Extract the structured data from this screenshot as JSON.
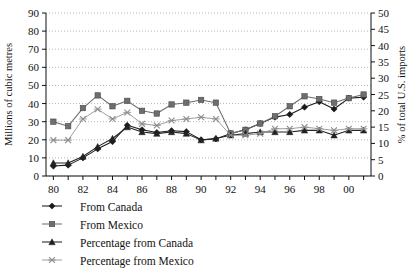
{
  "chart_data": {
    "type": "line",
    "title": "",
    "subtitle": "",
    "xlabel": "",
    "ylabel": "Millions of cubic metres",
    "y2label": "% of total U.S. imports",
    "xlim": [
      1979.5,
      2001.5
    ],
    "ylim": [
      0,
      90
    ],
    "y2lim": [
      0,
      50
    ],
    "grid": true,
    "legend_position": "below-left",
    "x": [
      1980,
      1981,
      1982,
      1983,
      1984,
      1985,
      1986,
      1987,
      1988,
      1989,
      1990,
      1991,
      1992,
      1993,
      1994,
      1995,
      1996,
      1997,
      1998,
      1999,
      2000,
      2001
    ],
    "x_tick_labels": [
      "80",
      "82",
      "84",
      "86",
      "88",
      "90",
      "92",
      "94",
      "96",
      "98",
      "00"
    ],
    "x_tick_values": [
      1980,
      1982,
      1984,
      1986,
      1988,
      1990,
      1992,
      1994,
      1996,
      1998,
      2000
    ],
    "y_tick_labels": [
      "0",
      "10",
      "20",
      "30",
      "40",
      "50",
      "60",
      "70",
      "80",
      "90"
    ],
    "y_tick_values": [
      0,
      10,
      20,
      30,
      40,
      50,
      60,
      70,
      80,
      90
    ],
    "y2_tick_labels": [
      "0",
      "5",
      "10",
      "15",
      "20",
      "25",
      "30",
      "35",
      "40",
      "45",
      "50"
    ],
    "y2_tick_values": [
      0,
      5,
      10,
      15,
      20,
      25,
      30,
      35,
      40,
      45,
      50
    ],
    "series": [
      {
        "name": "From Canada",
        "marker": "diamond",
        "axis": "left",
        "color": "#1a1a1a",
        "values": [
          5.5,
          6.0,
          10.0,
          15.0,
          19.0,
          28.0,
          25.5,
          24.0,
          25.0,
          24.5,
          20.0,
          20.5,
          23.5,
          25.5,
          29.0,
          32.5,
          34.0,
          38.0,
          41.0,
          37.0,
          43.0,
          43.5
        ]
      },
      {
        "name": "From Mexico",
        "marker": "square",
        "axis": "left",
        "color": "#6e6e6e",
        "values": [
          30.0,
          27.5,
          37.5,
          44.5,
          38.5,
          41.5,
          36.0,
          34.5,
          39.5,
          40.5,
          42.0,
          40.5,
          23.5,
          25.5,
          29.0,
          33.0,
          38.5,
          44.0,
          42.5,
          40.5,
          43.0,
          45.0
        ]
      },
      {
        "name": "Percentage from Canada",
        "marker": "triangle",
        "axis": "right",
        "color": "#222222",
        "values": [
          4.0,
          4.0,
          6.0,
          9.0,
          11.5,
          15.0,
          13.5,
          13.0,
          13.5,
          13.0,
          11.0,
          11.5,
          12.5,
          13.0,
          13.5,
          13.5,
          13.5,
          14.0,
          14.0,
          12.5,
          14.0,
          14.0
        ]
      },
      {
        "name": "Percentage from Mexico",
        "marker": "x",
        "axis": "right",
        "color": "#8c8c8c",
        "values": [
          11.0,
          11.0,
          17.5,
          20.5,
          17.5,
          19.5,
          16.0,
          15.5,
          17.0,
          17.5,
          18.0,
          17.5,
          12.5,
          12.5,
          13.0,
          14.5,
          14.5,
          15.0,
          14.5,
          14.0,
          14.5,
          14.5
        ]
      }
    ],
    "legend": [
      {
        "label": "From Canada",
        "marker": "diamond",
        "color": "#1a1a1a"
      },
      {
        "label": "From Mexico",
        "marker": "square",
        "color": "#6e6e6e"
      },
      {
        "label": "Percentage from Canada",
        "marker": "triangle",
        "color": "#222222"
      },
      {
        "label": "Percentage from Mexico",
        "marker": "x",
        "color": "#8c8c8c"
      }
    ]
  }
}
